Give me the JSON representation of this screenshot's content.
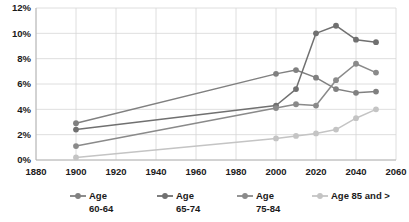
{
  "chart_data": {
    "type": "line",
    "title": "",
    "xlabel": "",
    "ylabel": "",
    "xlim": [
      1880,
      2060
    ],
    "ylim": [
      0,
      12
    ],
    "grid": true,
    "legend_position": "bottom",
    "x_ticks": [
      "1880",
      "1900",
      "1920",
      "1940",
      "1960",
      "1980",
      "2000",
      "2020",
      "2040",
      "2060"
    ],
    "y_ticks": [
      "0%",
      "2%",
      "4%",
      "6%",
      "8%",
      "10%",
      "12%"
    ],
    "series": [
      {
        "name": "Age 60-64",
        "legend_label_line1": "Age",
        "legend_label_line2": "60-64",
        "color": "#808080",
        "x": [
          1900,
          2000,
          2010,
          2020,
          2030,
          2040,
          2050
        ],
        "values": [
          2.9,
          6.8,
          7.1,
          6.5,
          5.6,
          5.3,
          5.4
        ]
      },
      {
        "name": "Age 65-74",
        "legend_label_line1": "Age",
        "legend_label_line2": "65-74",
        "color": "#707070",
        "x": [
          1900,
          2000,
          2010,
          2020,
          2030,
          2040,
          2050
        ],
        "values": [
          2.4,
          4.3,
          5.6,
          10.0,
          10.6,
          9.5,
          9.3
        ]
      },
      {
        "name": "Age 75-84",
        "legend_label_line1": "Age",
        "legend_label_line2": "75-84",
        "color": "#8a8a8a",
        "x": [
          1900,
          2000,
          2010,
          2020,
          2030,
          2040,
          2050
        ],
        "values": [
          1.1,
          4.1,
          4.4,
          4.3,
          6.3,
          7.6,
          6.9
        ]
      },
      {
        "name": "Age 85 and >",
        "legend_label_line1": "Age 85 and >",
        "legend_label_line2": "",
        "color": "#c4c4c4",
        "x": [
          1900,
          2000,
          2010,
          2020,
          2030,
          2040,
          2050
        ],
        "values": [
          0.2,
          1.7,
          1.9,
          2.1,
          2.4,
          3.3,
          4.0
        ]
      }
    ]
  }
}
